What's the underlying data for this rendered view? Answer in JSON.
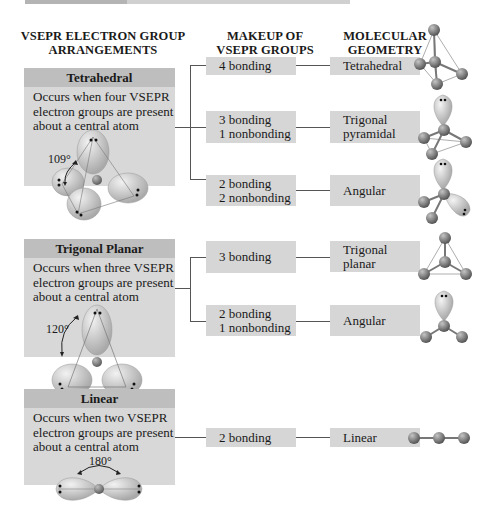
{
  "columns": {
    "arrangements": "VSEPR ELECTRON GROUP ARRANGEMENTS",
    "arrangements_l1": "VSEPR ELECTRON GROUP",
    "arrangements_l2": "ARRANGEMENTS",
    "makeup_l1": "MAKEUP OF",
    "makeup_l2": "VSEPR GROUPS",
    "geometry_l1": "MOLECULAR",
    "geometry_l2": "GEOMETRY"
  },
  "arrangements": [
    {
      "title": "Tetrahedral",
      "desc_l1": "Occurs when four VSEPR",
      "desc_l2": "electron groups are present",
      "desc_l3": "about a central atom",
      "angle": "109°",
      "rows": [
        {
          "makeup_l1": "4 bonding",
          "makeup_l2": "",
          "geometry_l1": "Tetrahedral",
          "geometry_l2": ""
        },
        {
          "makeup_l1": "3 bonding",
          "makeup_l2": "1 nonbonding",
          "geometry_l1": "Trigonal",
          "geometry_l2": "pyramidal"
        },
        {
          "makeup_l1": "2 bonding",
          "makeup_l2": "2 nonbonding",
          "geometry_l1": "Angular",
          "geometry_l2": ""
        }
      ]
    },
    {
      "title": "Trigonal Planar",
      "desc_l1": "Occurs when three VSEPR",
      "desc_l2": "electron groups are present",
      "desc_l3": "about a central atom",
      "angle": "120°",
      "rows": [
        {
          "makeup_l1": "3 bonding",
          "makeup_l2": "",
          "geometry_l1": "Trigonal",
          "geometry_l2": "planar"
        },
        {
          "makeup_l1": "2 bonding",
          "makeup_l2": "1 nonbonding",
          "geometry_l1": "Angular",
          "geometry_l2": ""
        }
      ]
    },
    {
      "title": "Linear",
      "desc_l1": "Occurs when two VSEPR",
      "desc_l2": "electron groups are present",
      "desc_l3": "about a central atom",
      "angle": "180°",
      "rows": [
        {
          "makeup_l1": "2 bonding",
          "makeup_l2": "",
          "geometry_l1": "Linear",
          "geometry_l2": ""
        }
      ]
    }
  ],
  "colors": {
    "panel_header": "#bebebe",
    "panel_body": "#d8d8d8",
    "box": "#d6d6d6",
    "connector": "#555555",
    "atom": "#8a8a8a",
    "lobe": "#cfcfcf"
  }
}
